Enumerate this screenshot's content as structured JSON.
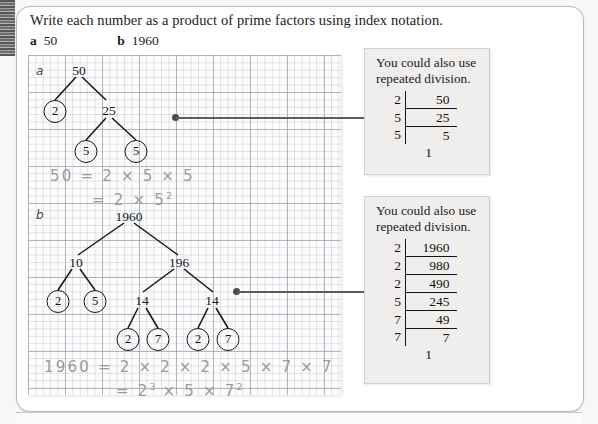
{
  "prompt": "Write each number as a product of prime factors using index notation.",
  "questions": [
    {
      "letter": "a",
      "number": "50"
    },
    {
      "letter": "b",
      "number": "1960"
    }
  ],
  "worksheet": {
    "part_a": {
      "label": "a",
      "tree": {
        "root": "50",
        "level2": [
          "2",
          "25"
        ],
        "level3": [
          "5",
          "5"
        ]
      },
      "working_line1": "50 = 2 × 5 × 5",
      "working_line2_prefix": "= 2 × 5",
      "working_line2_exponent": "2"
    },
    "part_b": {
      "label": "b",
      "tree": {
        "root": "1960",
        "level2": [
          "10",
          "196"
        ],
        "level3_left": [
          "2",
          "5"
        ],
        "level3_right": [
          "14",
          "14"
        ],
        "level4": [
          "2",
          "7",
          "2",
          "7"
        ]
      },
      "working_line1": "1960 = 2 × 2 × 2 × 5 × 7 × 7",
      "working_line2_prefix": "= 2",
      "working_line2_exp1": "3",
      "working_line2_mid": " × 5 × 7",
      "working_line2_exp2": "2"
    }
  },
  "notes": [
    {
      "text_line1": "You could also use",
      "text_line2": "repeated division.",
      "ladder": {
        "rows": [
          {
            "divisor": "2",
            "value": "50"
          },
          {
            "divisor": "5",
            "value": "25"
          },
          {
            "divisor": "5",
            "value": "5"
          }
        ],
        "final": "1"
      }
    },
    {
      "text_line1": "You could also use",
      "text_line2": "repeated division.",
      "ladder": {
        "rows": [
          {
            "divisor": "2",
            "value": "1960"
          },
          {
            "divisor": "2",
            "value": "980"
          },
          {
            "divisor": "2",
            "value": "490"
          },
          {
            "divisor": "5",
            "value": "245"
          },
          {
            "divisor": "7",
            "value": "49"
          },
          {
            "divisor": "7",
            "value": "7"
          }
        ],
        "final": "1"
      }
    }
  ],
  "colors": {
    "ink": "#141414",
    "pencil": "#9a9a9c",
    "note_bg": "#efeeec",
    "grid_line": "#96a0af"
  }
}
